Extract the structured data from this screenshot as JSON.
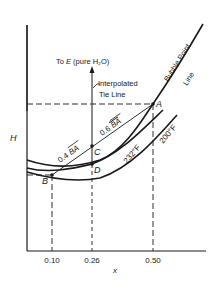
{
  "figure": {
    "y_axis_label": "H",
    "x_axis_label": "x",
    "x_ticks": [
      "0.10",
      "0.26",
      "0.50"
    ],
    "points": {
      "A": "A",
      "B": "B",
      "C": "C",
      "D": "D"
    },
    "annotations": {
      "to_e": "To E (pure H₂O)",
      "to_e_prefix": "To ",
      "to_e_letter": "E",
      "to_e_suffix": " (pure H₂O)",
      "interpolated_1": "Interpolated",
      "interpolated_2": "Tie Line",
      "bubble_1": "Bubble Point",
      "bubble_2": "Line",
      "seg_04": "0.4 BA",
      "seg_04_num": "0.4",
      "seg_06": "0.6 BA",
      "seg_06_num": "0.6",
      "seg_ba": "BA",
      "temp_232": "232°F",
      "temp_200": "200°F"
    },
    "colors": {
      "ink": "#1a1a1a",
      "background": "#ffffff"
    }
  }
}
